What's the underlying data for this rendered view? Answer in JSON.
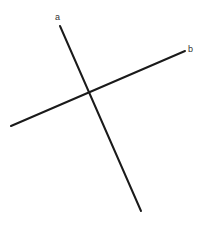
{
  "diagram": {
    "title_partial": "",
    "lines": [
      {
        "label": "a",
        "x1": 60,
        "y1": 26,
        "x2": 141,
        "y2": 211,
        "label_x": 55,
        "label_y": 20
      },
      {
        "label": "b",
        "x1": 11,
        "y1": 126,
        "x2": 185,
        "y2": 51,
        "label_x": 188,
        "label_y": 52
      }
    ],
    "intersection": {
      "x": 89,
      "y": 93
    },
    "stroke_color": "#1a1a1a"
  }
}
